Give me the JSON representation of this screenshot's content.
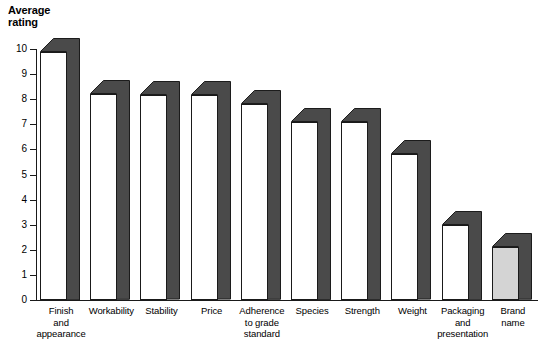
{
  "chart_data": {
    "type": "bar",
    "title": "Average\nrating",
    "xlabel": "",
    "ylabel": "Average rating",
    "ylim": [
      0,
      10
    ],
    "yticks": [
      0,
      1,
      2,
      3,
      4,
      5,
      6,
      7,
      8,
      9,
      10
    ],
    "grid": false,
    "legend": "none",
    "style": "3d-bar",
    "categories": [
      "Finish\nand\nappearance",
      "Workability",
      "Stability",
      "Price",
      "Adherence\nto grade\nstandard",
      "Species",
      "Strength",
      "Weight",
      "Packaging\nand\npresentation",
      "Brand\nname"
    ],
    "values": [
      9.9,
      8.2,
      8.15,
      8.15,
      7.8,
      7.1,
      7.1,
      5.8,
      3.0,
      2.1
    ],
    "bar_face_colors": [
      "#ffffff",
      "#ffffff",
      "#ffffff",
      "#ffffff",
      "#ffffff",
      "#ffffff",
      "#ffffff",
      "#ffffff",
      "#ffffff",
      "#d4d4d4"
    ],
    "bar_side_color": "#4a4a4a",
    "bar_outline_color": "#1a1a1a"
  },
  "colors": {
    "axis": "#1a1a1a",
    "background": "#ffffff",
    "side_face": "#4a4a4a",
    "highlight_face": "#d4d4d4"
  }
}
